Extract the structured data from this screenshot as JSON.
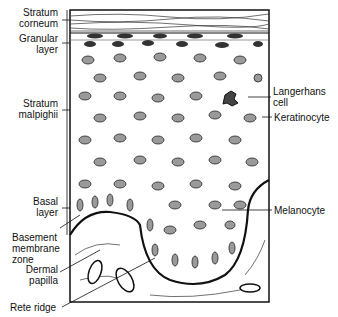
{
  "labels_left": [
    {
      "id": "stratum-corneum",
      "line1": "Stratum",
      "line2": "corneum"
    },
    {
      "id": "granular-layer",
      "line1": "Granular",
      "line2": "layer"
    },
    {
      "id": "stratum-malpighii",
      "line1": "Stratum",
      "line2": "malpighii"
    },
    {
      "id": "basal-layer",
      "line1": "Basal",
      "line2": "layer"
    },
    {
      "id": "basement-membrane-zone",
      "line1": "Basement",
      "line2": "membrane",
      "line3": "zone"
    },
    {
      "id": "dermal-papilla",
      "line1": "Dermal",
      "line2": "papilla"
    },
    {
      "id": "rete-ridge",
      "line1": "Rete ridge"
    }
  ],
  "labels_right": [
    {
      "id": "langerhans-cell",
      "line1": "Langerhans",
      "line2": "cell"
    },
    {
      "id": "keratinocyte",
      "line1": "Keratinocyte"
    },
    {
      "id": "melanocyte",
      "line1": "Melanocyte"
    }
  ],
  "colors": {
    "line": "#111111",
    "nucleus": "#9a9a9a",
    "background": "#ffffff"
  }
}
